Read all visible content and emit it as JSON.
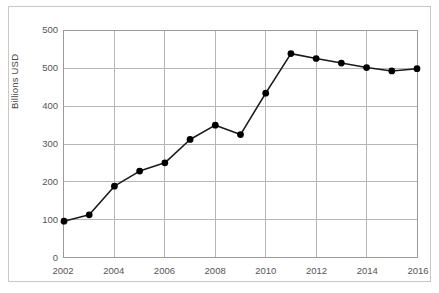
{
  "chart_data": {
    "type": "line",
    "title": "",
    "xlabel": "",
    "ylabel": "Billions USD",
    "x": [
      2002,
      2003,
      2004,
      2005,
      2006,
      2007,
      2008,
      2009,
      2010,
      2011,
      2012,
      2013,
      2014,
      2015,
      2016
    ],
    "values": [
      95,
      112,
      188,
      228,
      250,
      312,
      350,
      325,
      435,
      540,
      527,
      515,
      503,
      494,
      500
    ],
    "series": [
      {
        "name": "Billions USD",
        "values": [
          95,
          112,
          188,
          228,
          250,
          312,
          350,
          325,
          435,
          540,
          527,
          515,
          503,
          494,
          500
        ]
      }
    ],
    "xlim": [
      2002,
      2016
    ],
    "ylim": [
      0,
      600
    ],
    "xtick_labels": [
      "2002",
      "2004",
      "2006",
      "2008",
      "2010",
      "2012",
      "2014",
      "2016"
    ],
    "xtick_values": [
      2002,
      2004,
      2006,
      2008,
      2010,
      2012,
      2014,
      2016
    ],
    "ytick_labels": [
      "500",
      "500",
      "400",
      "300",
      "200",
      "100",
      "0"
    ],
    "ytick_values": [
      600,
      500,
      400,
      300,
      200,
      100,
      0
    ],
    "grid": true,
    "legend": "none",
    "marker": "filled-circle",
    "line_color": "#1a1a1a",
    "marker_color": "#000000",
    "grid_color": "#b5b5b5",
    "axis_color": "#9a9a9a",
    "tick_label_color": "#555555"
  }
}
